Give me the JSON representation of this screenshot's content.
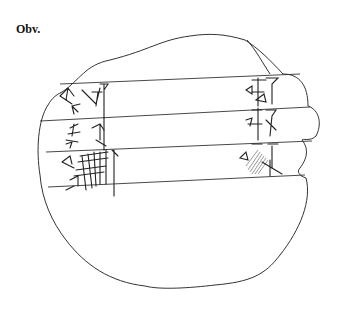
{
  "figure": {
    "side_label": "Obv.",
    "ruled_lines": 4,
    "text_lines": 3,
    "colors": {
      "ink": "#333333",
      "background": "#ffffff"
    }
  }
}
